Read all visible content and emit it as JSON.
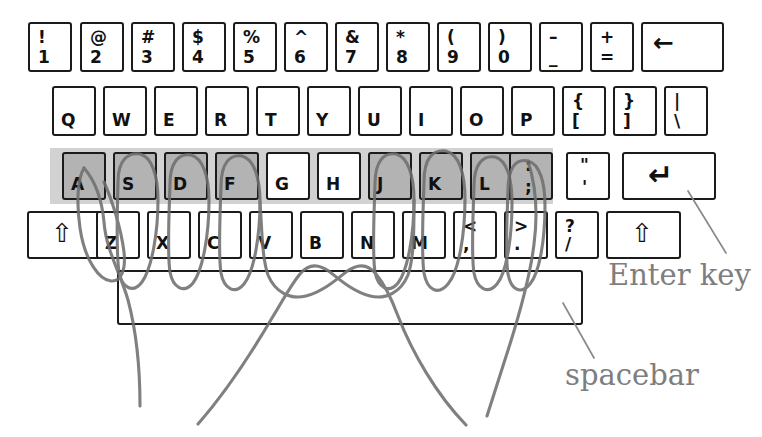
{
  "diagram": {
    "ink_color": "#6f6f6f",
    "key_outline_color": "#1b1b1b",
    "shaded_key_color": "#b3b3b3",
    "home_band_color": "#d2d2d2",
    "label_color": "#7e7e7e"
  },
  "rows": {
    "number_row": {
      "name": "number-row",
      "keys": [
        {
          "top": "!",
          "bottom": "1"
        },
        {
          "top": "@",
          "bottom": "2"
        },
        {
          "top": "#",
          "bottom": "3"
        },
        {
          "top": "$",
          "bottom": "4"
        },
        {
          "top": "%",
          "bottom": "5"
        },
        {
          "top": "^",
          "bottom": "6"
        },
        {
          "top": "&",
          "bottom": "7"
        },
        {
          "top": "*",
          "bottom": "8"
        },
        {
          "top": "(",
          "bottom": "9"
        },
        {
          "top": ")",
          "bottom": "0"
        },
        {
          "top": "–",
          "bottom": "_"
        },
        {
          "top": "+",
          "bottom": "="
        }
      ],
      "backspace": {
        "name": "backspace-key",
        "symbol": "←"
      }
    },
    "top_row": {
      "name": "qwerty-row",
      "keys": [
        {
          "letter": "Q"
        },
        {
          "letter": "W"
        },
        {
          "letter": "E"
        },
        {
          "letter": "R"
        },
        {
          "letter": "T"
        },
        {
          "letter": "Y"
        },
        {
          "letter": "U"
        },
        {
          "letter": "I"
        },
        {
          "letter": "O"
        },
        {
          "letter": "P"
        },
        {
          "top": "{",
          "bottom": "["
        },
        {
          "top": "}",
          "bottom": "]"
        },
        {
          "top": "|",
          "bottom": "\\"
        }
      ]
    },
    "home_row": {
      "name": "home-row",
      "keys": [
        {
          "letter": "A",
          "shaded": true
        },
        {
          "letter": "S",
          "shaded": true
        },
        {
          "letter": "D",
          "shaded": true
        },
        {
          "letter": "F",
          "shaded": true
        },
        {
          "letter": "G",
          "shaded": false
        },
        {
          "letter": "H",
          "shaded": false
        },
        {
          "letter": "J",
          "shaded": true
        },
        {
          "letter": "K",
          "shaded": true
        },
        {
          "letter": "L",
          "shaded": true
        },
        {
          "top": ":",
          "bottom": ";",
          "shaded": true
        },
        {
          "top": "\"",
          "bottom": "'",
          "shaded": false
        }
      ],
      "enter": {
        "name": "enter-key",
        "symbol": "↵"
      }
    },
    "bottom_row": {
      "name": "zxcv-row",
      "left_shift": {
        "name": "left-shift-key",
        "symbol": "⇧"
      },
      "keys": [
        {
          "letter": "Z"
        },
        {
          "letter": "X"
        },
        {
          "letter": "C"
        },
        {
          "letter": "V"
        },
        {
          "letter": "B"
        },
        {
          "letter": "N"
        },
        {
          "letter": "M"
        },
        {
          "top": "<",
          "bottom": ","
        },
        {
          "top": ">",
          "bottom": "."
        },
        {
          "top": "?",
          "bottom": "/"
        }
      ],
      "right_shift": {
        "name": "right-shift-key",
        "symbol": "⇧"
      }
    },
    "space_row": {
      "name": "spacebar-row",
      "spacebar": {
        "name": "spacebar-key",
        "label": ""
      }
    }
  },
  "callouts": [
    {
      "name": "enter-key-callout",
      "text": "Enter key"
    },
    {
      "name": "spacebar-callout",
      "text": "spacebar"
    }
  ],
  "annotations": {
    "home_keys_marked": [
      "A",
      "S",
      "D",
      "F",
      "J",
      "K",
      "L",
      ":"
    ],
    "finger_loops": 8,
    "thumb_strokes": 2
  }
}
